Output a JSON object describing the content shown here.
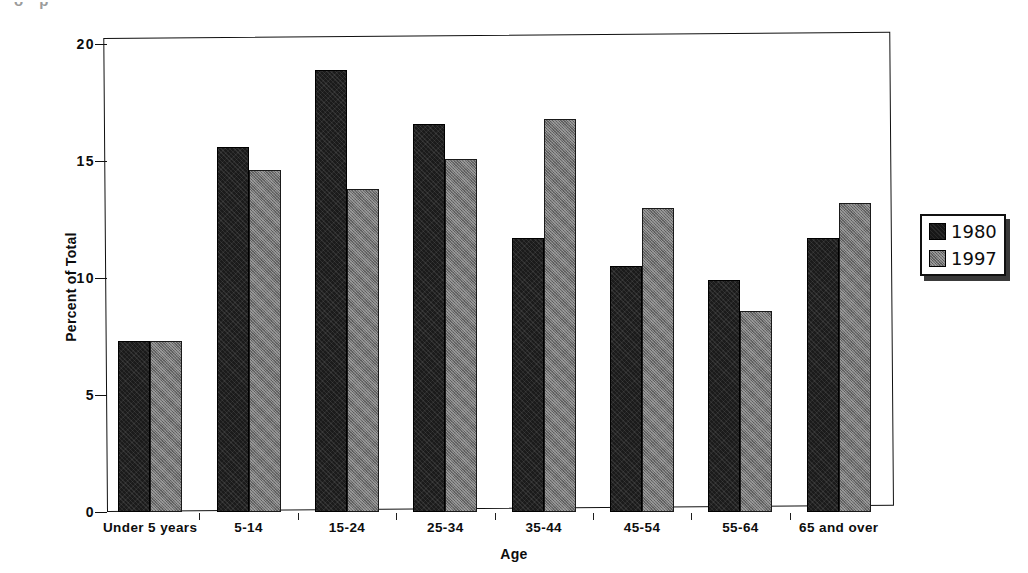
{
  "scan_artifact_text": "o p",
  "chart_data": {
    "type": "bar",
    "title": "",
    "xlabel": "Age",
    "ylabel": "Percent of Total",
    "ylim": [
      0,
      20
    ],
    "yticks": [
      0,
      5,
      10,
      15,
      20
    ],
    "ytick_labels": [
      "0",
      "5",
      "10",
      "15",
      "20"
    ],
    "grid": false,
    "legend_position": "right",
    "categories": [
      "Under 5 years",
      "5-14",
      "15-24",
      "25-34",
      "35-44",
      "45-54",
      "55-64",
      "65 and over"
    ],
    "series": [
      {
        "name": "1980",
        "color": "#1b1b1b",
        "values": [
          7.3,
          15.6,
          18.9,
          16.6,
          11.7,
          10.5,
          9.9,
          11.7
        ]
      },
      {
        "name": "1997",
        "color": "#6f6f6f",
        "values": [
          7.3,
          14.6,
          13.8,
          15.1,
          16.8,
          13.0,
          8.6,
          13.2
        ]
      }
    ]
  },
  "legend": {
    "entries": [
      {
        "label": "1980",
        "swatch": "dark-swatch"
      },
      {
        "label": "1997",
        "swatch": "gray-swatch"
      }
    ]
  }
}
